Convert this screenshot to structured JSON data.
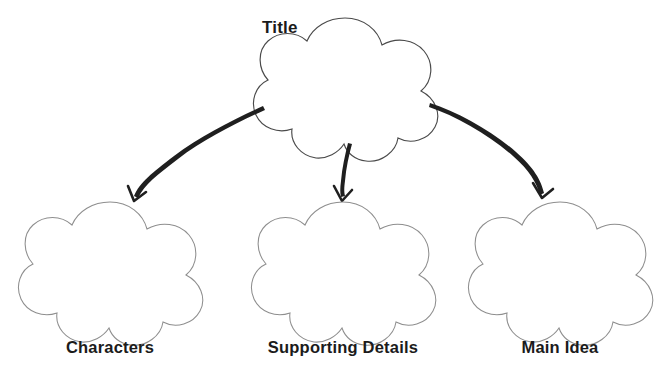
{
  "document": {
    "type": "graphic-organizer",
    "subtype": "story-map-cluster",
    "background_color": "#ffffff"
  },
  "colors": {
    "text": "#1b1b1b",
    "top_shape_outline": "#4a4a4a",
    "leaf_shape_outline": "#8e8e8e",
    "arrow": "#1f1f1f",
    "shape_fill": "#ffffff"
  },
  "nodes": {
    "root": {
      "label": "Title",
      "shape": "five-lobed-cloud",
      "label_position": "above-left",
      "center": {
        "x": 345,
        "y": 81
      },
      "radius": 62
    },
    "children": [
      {
        "id": "characters",
        "label": "Characters",
        "shape": "five-lobed-cloud",
        "label_position": "below",
        "center": {
          "x": 110,
          "y": 265
        },
        "radius": 63
      },
      {
        "id": "supporting-details",
        "label": "Supporting Details",
        "shape": "five-lobed-cloud",
        "label_position": "below",
        "center": {
          "x": 343,
          "y": 265
        },
        "radius": 63
      },
      {
        "id": "main-idea",
        "label": "Main Idea",
        "shape": "five-lobed-cloud",
        "label_position": "below",
        "center": {
          "x": 560,
          "y": 265
        },
        "radius": 63
      }
    ]
  },
  "connectors": [
    {
      "id": "root-to-characters",
      "from": "root",
      "to": "characters",
      "style": "curved-arrow",
      "direction": "down-left"
    },
    {
      "id": "root-to-supporting-details",
      "from": "root",
      "to": "supporting-details",
      "style": "curved-arrow",
      "direction": "down"
    },
    {
      "id": "root-to-main-idea",
      "from": "root",
      "to": "main-idea",
      "style": "curved-arrow",
      "direction": "down-right"
    }
  ]
}
